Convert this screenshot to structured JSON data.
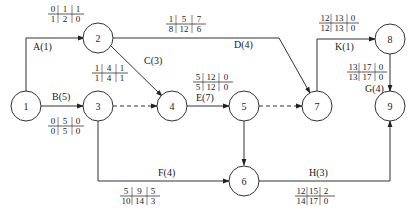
{
  "diagram": {
    "type": "activity-on-arrow network (time parameters)",
    "nodes": [
      {
        "id": "1",
        "label": "1",
        "x": 26,
        "y": 186
      },
      {
        "id": "2",
        "label": "2",
        "x": 98,
        "y": 38
      },
      {
        "id": "3",
        "label": "3",
        "x": 98,
        "y": 186
      },
      {
        "id": "4",
        "label": "4",
        "x": 172,
        "y": 186
      },
      {
        "id": "5",
        "label": "5",
        "x": 244,
        "y": 186
      },
      {
        "id": "6",
        "label": "6",
        "x": 244,
        "y": 180
      },
      {
        "id": "7",
        "label": "7",
        "x": 317,
        "y": 186
      },
      {
        "id": "8",
        "label": "8",
        "x": 390,
        "y": 39
      },
      {
        "id": "9",
        "label": "9",
        "x": 390,
        "y": 186
      }
    ],
    "activities": [
      {
        "name": "A(1)",
        "from": "1",
        "to": "2",
        "params": {
          "es": "0",
          "ef": "1",
          "ff": "1",
          "ls": "1",
          "lf": "2",
          "tf": "0"
        }
      },
      {
        "name": "B(5)",
        "from": "1",
        "to": "3",
        "params": {
          "es": "0",
          "ef": "5",
          "ff": "0",
          "ls": "0",
          "lf": "5",
          "tf": "0"
        }
      },
      {
        "name": "C(3)",
        "from": "2",
        "to": "4",
        "params": {
          "es": "1",
          "ef": "4",
          "ff": "1",
          "ls": "1",
          "lf": "4",
          "tf": "1"
        }
      },
      {
        "name": "D(4)",
        "from": "2",
        "to": "7",
        "params": {
          "es": "1",
          "ef": "5",
          "ff": "7",
          "ls": "8",
          "lf": "12",
          "tf": "6"
        }
      },
      {
        "name": "E(7)",
        "from": "4",
        "to": "5",
        "params": {
          "es": "5",
          "ef": "12",
          "ff": "0",
          "ls": "5",
          "lf": "12",
          "tf": "0"
        }
      },
      {
        "name": "F(4)",
        "from": "3",
        "to": "6",
        "params": {
          "es": "5",
          "ef": "9",
          "ff": "5",
          "ls": "10",
          "lf": "14",
          "tf": "3"
        }
      },
      {
        "name": "H(3)",
        "from": "6",
        "to": "9",
        "params": {
          "es": "12",
          "ef": "15",
          "ff": "2",
          "ls": "14",
          "lf": "17",
          "tf": "0"
        }
      },
      {
        "name": "K(1)",
        "from": "7",
        "to": "8",
        "params": {
          "es": "12",
          "ef": "13",
          "ff": "0",
          "ls": "12",
          "lf": "13",
          "tf": "0"
        }
      },
      {
        "name": "G(4)",
        "from": "8",
        "to": "9",
        "params": {
          "es": "13",
          "ef": "17",
          "ff": "0",
          "ls": "13",
          "lf": "17",
          "tf": "0"
        }
      }
    ],
    "dummies": [
      {
        "from": "3",
        "to": "4"
      },
      {
        "from": "5",
        "to": "7"
      },
      {
        "from": "5",
        "to": "6"
      }
    ]
  }
}
